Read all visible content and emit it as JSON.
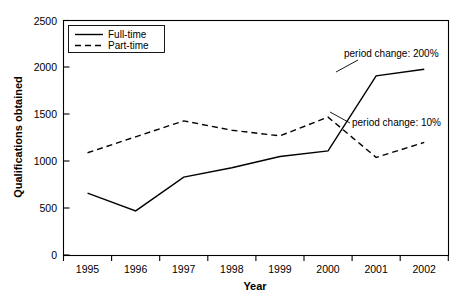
{
  "chart_data": {
    "type": "line",
    "title": "",
    "xlabel": "Year",
    "ylabel": "Qualifications obtained",
    "categories": [
      "1995",
      "1996",
      "1997",
      "1998",
      "1999",
      "2000",
      "2001",
      "2002"
    ],
    "x": [
      1995,
      1996,
      1997,
      1998,
      1999,
      2000,
      2001,
      2002
    ],
    "series": [
      {
        "name": "Full-time",
        "style": "solid",
        "values": [
          660,
          470,
          830,
          930,
          1050,
          1110,
          1910,
          1980
        ]
      },
      {
        "name": "Part-time",
        "style": "dashed",
        "values": [
          1090,
          1260,
          1430,
          1330,
          1270,
          1470,
          1040,
          1200
        ]
      }
    ],
    "ylim": [
      0,
      2500
    ],
    "ytick_values": [
      0,
      500,
      1000,
      1500,
      2000,
      2500
    ],
    "ytick_labels": [
      "0",
      "500",
      "1000",
      "1500",
      "2000",
      "2500"
    ],
    "xtick_labels": [
      "1995",
      "1996",
      "1997",
      "1998",
      "1999",
      "2000",
      "2001",
      "2002"
    ],
    "grid": false,
    "legend_position": "top-left",
    "legend_entries": [
      "Full-time",
      "Part-time"
    ],
    "annotations": [
      {
        "text": "period change: 200%",
        "target_series": "Full-time"
      },
      {
        "text": "period change: 10%",
        "target_series": "Part-time"
      }
    ],
    "colors": {
      "axis": "#000000",
      "series": "#000000",
      "background": "#ffffff"
    }
  }
}
